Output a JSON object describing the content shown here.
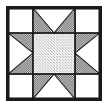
{
  "canvas": {
    "width": 109,
    "height": 110,
    "background": "#ffffff"
  },
  "block": {
    "title": "Sawtooth Star Quilt Block",
    "pattern_name": "Variable Star",
    "grid": "3x3",
    "frame": {
      "x": 6,
      "y": 6,
      "width": 96,
      "height": 95,
      "border_color": "#1a1a1a",
      "border_width": 2
    },
    "colors": {
      "background": "#ffffff",
      "outline": "#1a1a1a",
      "center_fill": "#d5d5d5",
      "point_fill": "#8a8a8a",
      "grid_line": "#1a1a1a"
    },
    "cells": [
      {
        "row": 0,
        "col": 0,
        "name": "corner-top-left",
        "type": "plain",
        "fill": "background"
      },
      {
        "row": 0,
        "col": 1,
        "name": "point-top",
        "type": "flying-geese",
        "direction": "up",
        "fill": "point_fill"
      },
      {
        "row": 0,
        "col": 2,
        "name": "corner-top-right",
        "type": "plain",
        "fill": "background"
      },
      {
        "row": 1,
        "col": 0,
        "name": "point-left",
        "type": "flying-geese",
        "direction": "left",
        "fill": "point_fill"
      },
      {
        "row": 1,
        "col": 1,
        "name": "center-square",
        "type": "plain",
        "fill": "center_fill"
      },
      {
        "row": 1,
        "col": 2,
        "name": "point-right",
        "type": "flying-geese",
        "direction": "right",
        "fill": "point_fill"
      },
      {
        "row": 2,
        "col": 0,
        "name": "corner-bottom-left",
        "type": "plain",
        "fill": "background"
      },
      {
        "row": 2,
        "col": 1,
        "name": "point-bottom",
        "type": "flying-geese",
        "direction": "down",
        "fill": "point_fill"
      },
      {
        "row": 2,
        "col": 2,
        "name": "corner-bottom-right",
        "type": "plain",
        "fill": "background"
      }
    ],
    "divisions": {
      "x": [
        0,
        26,
        70,
        96
      ],
      "y": [
        0,
        26,
        69,
        95
      ]
    }
  }
}
